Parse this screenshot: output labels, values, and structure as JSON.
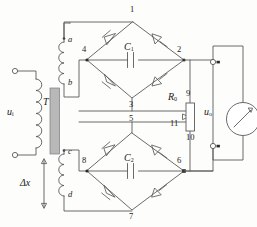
{
  "figure": {
    "type": "circuit-schematic",
    "background": "#fdfdfb",
    "line_color": "#4a4a4a",
    "text_color": "#1a1a1a"
  },
  "labels": {
    "input_voltage": "u",
    "input_voltage_sub": "i",
    "output_voltage": "u",
    "output_voltage_sub": "o",
    "transformer": "T",
    "displacement": "Δx",
    "cap_top": "C",
    "cap_top_sub": "1",
    "cap_bottom": "C",
    "cap_bottom_sub": "2",
    "resistor": "R",
    "resistor_sub": "0"
  },
  "nodes": [
    {
      "id": "1",
      "label": "1",
      "x": 133,
      "y": 9,
      "role": "bridge-top-apex-upper"
    },
    {
      "id": "2",
      "label": "2",
      "x": 184,
      "y": 49,
      "role": "bridge-right-node-upper"
    },
    {
      "id": "3",
      "label": "3",
      "x": 132,
      "y": 106,
      "role": "bridge-bottom-apex-upper"
    },
    {
      "id": "4",
      "label": "4",
      "x": 87,
      "y": 49,
      "role": "bridge-left-node-upper"
    },
    {
      "id": "5",
      "label": "5",
      "x": 132,
      "y": 120,
      "role": "bridge-top-apex-lower"
    },
    {
      "id": "6",
      "label": "6",
      "x": 184,
      "y": 160,
      "role": "bridge-right-node-lower"
    },
    {
      "id": "7",
      "label": "7",
      "x": 132,
      "y": 216,
      "role": "bridge-bottom-apex-lower"
    },
    {
      "id": "8",
      "label": "8",
      "x": 87,
      "y": 160,
      "role": "bridge-left-node-lower"
    },
    {
      "id": "9",
      "label": "9",
      "x": 190,
      "y": 98,
      "role": "resistor-upper-half"
    },
    {
      "id": "10",
      "label": "10",
      "x": 190,
      "y": 132,
      "role": "resistor-lower-half"
    },
    {
      "id": "11",
      "label": "11",
      "x": 175,
      "y": 125,
      "role": "potentiometer-wiper"
    }
  ],
  "terminals": [
    {
      "id": "a",
      "label": "a",
      "x": 69,
      "y": 40,
      "role": "secondary-upper-top"
    },
    {
      "id": "b",
      "label": "b",
      "x": 69,
      "y": 83,
      "role": "secondary-upper-bottom"
    },
    {
      "id": "c",
      "label": "c",
      "x": 69,
      "y": 152,
      "role": "secondary-lower-top"
    },
    {
      "id": "d",
      "label": "d",
      "x": 69,
      "y": 195,
      "role": "secondary-lower-bottom"
    }
  ],
  "components": [
    {
      "name": "transformer-core",
      "kind": "core",
      "x": 50,
      "y": 88,
      "w": 10,
      "h": 65
    },
    {
      "name": "primary-winding",
      "kind": "coil",
      "turns": 6
    },
    {
      "name": "secondary-winding-upper",
      "kind": "coil",
      "turns": 4
    },
    {
      "name": "secondary-winding-lower",
      "kind": "coil",
      "turns": 4
    },
    {
      "name": "diode-bridge-upper",
      "kind": "bridge",
      "diodes": 4
    },
    {
      "name": "diode-bridge-lower",
      "kind": "bridge",
      "diodes": 4
    },
    {
      "name": "capacitor-c1",
      "kind": "capacitor"
    },
    {
      "name": "capacitor-c2",
      "kind": "capacitor"
    },
    {
      "name": "potentiometer-r0",
      "kind": "potentiometer"
    },
    {
      "name": "output-meter",
      "kind": "meter"
    },
    {
      "name": "input-terminal-top",
      "kind": "terminal"
    },
    {
      "name": "input-terminal-bottom",
      "kind": "terminal"
    },
    {
      "name": "output-terminal-top",
      "kind": "terminal"
    },
    {
      "name": "output-terminal-bottom",
      "kind": "terminal"
    }
  ]
}
